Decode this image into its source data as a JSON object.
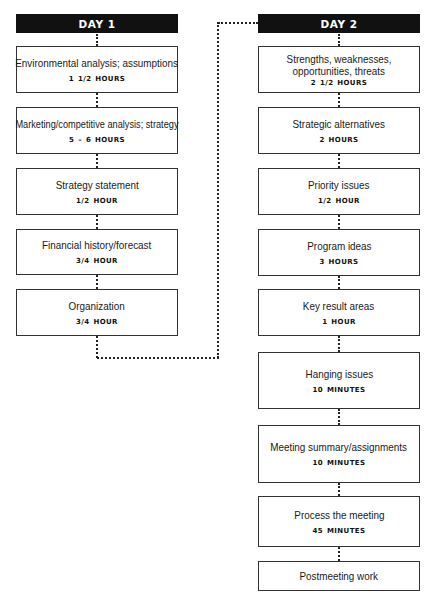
{
  "day1": {
    "header": "DAY 1",
    "steps": [
      {
        "title": "Environmental analysis; assumptions",
        "duration": "1  1/2 HOURS"
      },
      {
        "title": "Marketing/competitive analysis; strategy",
        "duration": "5 – 6 HOURS"
      },
      {
        "title": "Strategy statement",
        "duration": "1/2 HOUR"
      },
      {
        "title": "Financial history/forecast",
        "duration": "3/4 HOUR"
      },
      {
        "title": "Organization",
        "duration": "3/4 HOUR"
      }
    ]
  },
  "day2": {
    "header": "DAY 2",
    "steps": [
      {
        "title_lines": [
          "Strengths, weaknesses,",
          "opportunities, threats"
        ],
        "duration": "2  1/2 HOURS"
      },
      {
        "title": "Strategic alternatives",
        "duration": "2 HOURS"
      },
      {
        "title": "Priority issues",
        "duration": "1/2 HOUR"
      },
      {
        "title": "Program ideas",
        "duration": "3 HOURS"
      },
      {
        "title": "Key result areas",
        "duration": "1 HOUR"
      },
      {
        "title": "Hanging issues",
        "duration": "10 MINUTES"
      },
      {
        "title": "Meeting summary/assignments",
        "duration": "10 MINUTES"
      },
      {
        "title": "Process the meeting",
        "duration": "45 MINUTES"
      },
      {
        "title": "Postmeeting work"
      }
    ]
  },
  "colors": {
    "header_bg": "#111111",
    "header_text": "#ffffff",
    "border": "#333333",
    "connector": "#222222"
  }
}
